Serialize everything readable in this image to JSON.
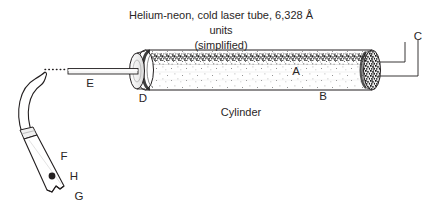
{
  "figure": {
    "title_line1": "Helium-neon, cold laser tube, 6,328 Å units",
    "title_line2": "(simplified)",
    "caption": "Cylinder",
    "background_color": "#ffffff",
    "ink_color": "#231f20",
    "labels": {
      "A": "A",
      "B": "B",
      "C": "C",
      "D": "D",
      "E": "E",
      "F": "F",
      "G": "G",
      "H": "H"
    }
  }
}
